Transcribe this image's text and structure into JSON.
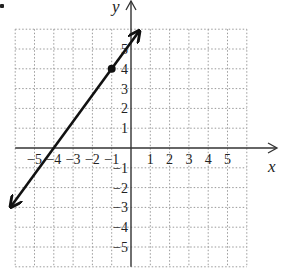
{
  "chart_data": {
    "type": "line",
    "title": "",
    "xlabel": "x",
    "ylabel": "y",
    "xlim": [
      -6,
      6
    ],
    "ylim": [
      -6,
      6
    ],
    "grid": true,
    "grid_style": "dotted",
    "x_ticks": [
      -5,
      -4,
      -3,
      -2,
      -1,
      1,
      2,
      3,
      4,
      5
    ],
    "y_ticks": [
      -5,
      -4,
      -3,
      -2,
      -1,
      1,
      2,
      3,
      4,
      5
    ],
    "x_tick_labels": [
      "−5",
      "−4",
      "−3",
      "−2",
      "−1",
      "1",
      "2",
      "3",
      "4",
      "5"
    ],
    "y_tick_labels": [
      "−5",
      "−4",
      "−3",
      "−2",
      "−1",
      "1",
      "2",
      "3",
      "4",
      "5"
    ],
    "series": [
      {
        "name": "line",
        "kind": "line-with-arrows",
        "slope": 1.3333,
        "y_intercept": 5.3333,
        "x_intercept": -4,
        "points": [
          {
            "x": -6.2,
            "y": -2.93
          },
          {
            "x": 0.4,
            "y": 5.87
          }
        ]
      }
    ],
    "highlighted_points": [
      {
        "x": -1,
        "y": 4,
        "style": "filled-dot"
      }
    ]
  },
  "labels": {
    "x_axis": "x",
    "y_axis": "y"
  },
  "colors": {
    "line": "#111111",
    "grid": "#9a9a9a",
    "axis": "#333333",
    "text": "#222222"
  }
}
